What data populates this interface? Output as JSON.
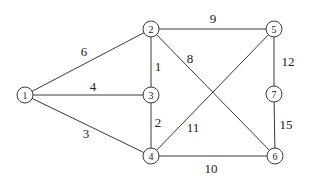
{
  "diagram": {
    "type": "weighted-undirected-graph",
    "nodes": [
      {
        "id": "1",
        "label": "1",
        "x": 25,
        "y": 95
      },
      {
        "id": "2",
        "label": "2",
        "x": 151,
        "y": 29
      },
      {
        "id": "3",
        "label": "3",
        "x": 151,
        "y": 95
      },
      {
        "id": "4",
        "label": "4",
        "x": 151,
        "y": 156
      },
      {
        "id": "5",
        "label": "5",
        "x": 274,
        "y": 29
      },
      {
        "id": "6",
        "label": "6",
        "x": 275,
        "y": 156
      },
      {
        "id": "7",
        "label": "7",
        "x": 274,
        "y": 94
      }
    ],
    "edges": [
      {
        "from": "1",
        "to": "2",
        "weight": "6",
        "lx": 84,
        "ly": 51
      },
      {
        "from": "1",
        "to": "3",
        "weight": "4",
        "lx": 93,
        "ly": 86
      },
      {
        "from": "1",
        "to": "4",
        "weight": "3",
        "lx": 86,
        "ly": 133
      },
      {
        "from": "2",
        "to": "5",
        "weight": "9",
        "lx": 213,
        "ly": 18
      },
      {
        "from": "2",
        "to": "3",
        "weight": "1",
        "lx": 158,
        "ly": 66
      },
      {
        "from": "2",
        "to": "6",
        "weight": "8",
        "lx": 190,
        "ly": 58
      },
      {
        "from": "3",
        "to": "4",
        "weight": "2",
        "lx": 158,
        "ly": 122
      },
      {
        "from": "4",
        "to": "5",
        "weight": "11",
        "lx": 193,
        "ly": 127
      },
      {
        "from": "4",
        "to": "6",
        "weight": "10",
        "lx": 211,
        "ly": 168
      },
      {
        "from": "5",
        "to": "7",
        "weight": "12",
        "lx": 288,
        "ly": 61
      },
      {
        "from": "7",
        "to": "6",
        "weight": "15",
        "lx": 286,
        "ly": 124
      }
    ]
  }
}
